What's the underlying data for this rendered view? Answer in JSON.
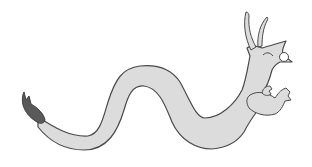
{
  "image": {
    "subject": "dragon illustration",
    "colors": {
      "background": "#ffffff",
      "body": "#dcdcdc",
      "outline": "#4a4a4a",
      "tail_tuft": "#5a5a5a",
      "eye": "#ffffff"
    }
  }
}
